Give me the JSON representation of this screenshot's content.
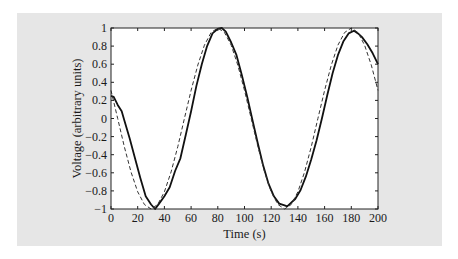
{
  "chart_data": {
    "type": "line",
    "title": "",
    "xlabel": "Time (s)",
    "ylabel": "Voltage (arbitrary units)",
    "xlim": [
      0,
      200
    ],
    "ylim": [
      -1,
      1
    ],
    "xticks": [
      0,
      20,
      40,
      60,
      80,
      100,
      120,
      140,
      160,
      180,
      200
    ],
    "yticks": [
      -1,
      -0.8,
      -0.6,
      -0.4,
      -0.2,
      0,
      0.2,
      0.4,
      0.6,
      0.8,
      1
    ],
    "grid": false,
    "legend": null,
    "series": [
      {
        "name": "measured",
        "style": "solid",
        "color": "#111111",
        "x": [
          0,
          2,
          5,
          8,
          10,
          14,
          18,
          22,
          26,
          30,
          33,
          36,
          40,
          44,
          48,
          52,
          56,
          60,
          64,
          68,
          72,
          76,
          80,
          83,
          86,
          90,
          94,
          98,
          102,
          106,
          110,
          114,
          118,
          122,
          126,
          130,
          132,
          135,
          138,
          142,
          146,
          150,
          154,
          158,
          162,
          166,
          170,
          174,
          178,
          182,
          185,
          188,
          192,
          196,
          200
        ],
        "y": [
          0.25,
          0.24,
          0.15,
          0.08,
          -0.02,
          -0.22,
          -0.44,
          -0.66,
          -0.86,
          -0.95,
          -1.0,
          -0.94,
          -0.86,
          -0.76,
          -0.58,
          -0.44,
          -0.18,
          0.08,
          0.36,
          0.6,
          0.8,
          0.94,
          0.99,
          1.0,
          0.96,
          0.84,
          0.7,
          0.48,
          0.24,
          -0.02,
          -0.28,
          -0.52,
          -0.72,
          -0.86,
          -0.94,
          -0.96,
          -0.97,
          -0.93,
          -0.89,
          -0.79,
          -0.64,
          -0.45,
          -0.24,
          -0.0,
          0.26,
          0.5,
          0.7,
          0.85,
          0.94,
          0.97,
          0.94,
          0.9,
          0.82,
          0.72,
          0.6
        ]
      },
      {
        "name": "reference",
        "style": "dashed",
        "color": "#333333",
        "x": [
          0,
          5,
          10,
          15,
          20,
          25,
          30,
          35,
          40,
          45,
          50,
          55,
          60,
          65,
          70,
          75,
          80,
          85,
          90,
          95,
          100,
          105,
          110,
          115,
          120,
          125,
          130,
          135,
          140,
          145,
          150,
          155,
          160,
          165,
          170,
          175,
          180,
          185,
          190,
          195,
          200
        ],
        "y": [
          0.31,
          0.0,
          -0.31,
          -0.59,
          -0.81,
          -0.95,
          -1.0,
          -0.95,
          -0.81,
          -0.59,
          -0.31,
          0.0,
          0.31,
          0.59,
          0.81,
          0.95,
          1.0,
          0.95,
          0.81,
          0.59,
          0.31,
          0.0,
          -0.31,
          -0.59,
          -0.81,
          -0.95,
          -1.0,
          -0.95,
          -0.81,
          -0.59,
          -0.31,
          0.0,
          0.31,
          0.59,
          0.81,
          0.95,
          1.0,
          0.95,
          0.81,
          0.59,
          0.31
        ]
      }
    ]
  },
  "colors": {
    "panel_background": "#e6e6e6",
    "plot_background": "#ffffff",
    "axis": "#222222"
  }
}
